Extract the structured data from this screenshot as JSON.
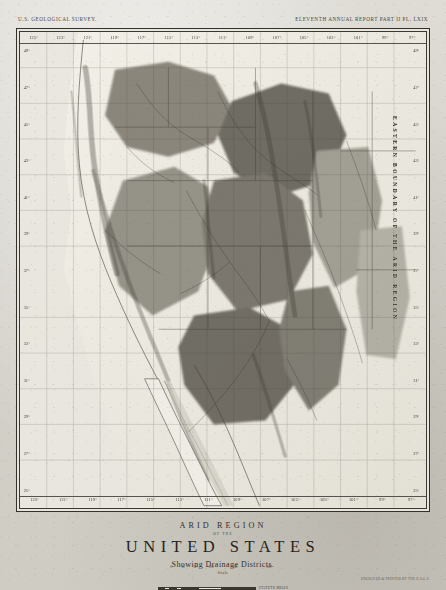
{
  "plate": {
    "running_head_left": "U.S. GEOLOGICAL SURVEY.",
    "running_head_right": "ELEVENTH ANNUAL REPORT PART II PL. LXIX"
  },
  "title_block": {
    "line1": "ARID REGION",
    "line2": "OF THE",
    "line3": "UNITED STATES",
    "line4": "Showing Drainage Districts."
  },
  "scale": {
    "label": "Scale",
    "units": "STATUTE MILES",
    "tick_labels": [
      "0",
      "25",
      "50",
      "100",
      "200",
      "300"
    ]
  },
  "map": {
    "eastern_boundary_label": "EASTERN BOUNDARY OF THE ARID REGION",
    "longitude_ticks_top": [
      "125°",
      "123°",
      "121°",
      "119°",
      "117°",
      "115°",
      "113°",
      "111°",
      "109°",
      "107°",
      "105°",
      "103°",
      "101°",
      "99°",
      "97°"
    ],
    "longitude_ticks_bottom": [
      "123°",
      "121°",
      "119°",
      "117°",
      "115°",
      "113°",
      "111°",
      "109°",
      "107°",
      "105°",
      "103°",
      "101°",
      "99°",
      "97°"
    ],
    "latitude_ticks_left": [
      "49°",
      "47°",
      "45°",
      "43°",
      "41°",
      "39°",
      "37°",
      "35°",
      "33°",
      "31°",
      "29°",
      "27°",
      "25°"
    ],
    "latitude_ticks_right": [
      "49°",
      "47°",
      "45°",
      "43°",
      "41°",
      "39°",
      "37°",
      "35°",
      "33°",
      "31°",
      "29°",
      "27°",
      "25°"
    ]
  },
  "credit": "ENGRAVED & PRINTED BY THE U.S.G.S."
}
